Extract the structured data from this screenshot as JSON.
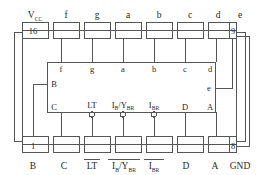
{
  "diagram": {
    "type": "ic-pinout",
    "colors": {
      "line": "#555555",
      "text": "#2a2a2a",
      "background": "#ffffff"
    },
    "package": {
      "top_left_pin_number": "16",
      "top_right_pin_number": "9",
      "bottom_left_pin_number": "1",
      "bottom_right_pin_number": "8"
    },
    "top_pins": [
      {
        "number": "16",
        "label": "Vcc",
        "label_base": "V",
        "label_sub": "CC",
        "inner_label": ""
      },
      {
        "number": "15",
        "label": "f",
        "label_base": "f",
        "label_sub": "",
        "inner_label": "f"
      },
      {
        "number": "14",
        "label": "g",
        "label_base": "g",
        "label_sub": "",
        "inner_label": "g"
      },
      {
        "number": "13",
        "label": "a",
        "label_base": "a",
        "label_sub": "",
        "inner_label": "a"
      },
      {
        "number": "12",
        "label": "b",
        "label_base": "b",
        "label_sub": "",
        "inner_label": "b"
      },
      {
        "number": "11",
        "label": "c",
        "label_base": "c",
        "label_sub": "",
        "inner_label": "c"
      },
      {
        "number": "10",
        "label": "d",
        "label_base": "d",
        "label_sub": "",
        "inner_label": "d"
      },
      {
        "number": "9",
        "label": "e",
        "label_base": "e",
        "label_sub": "",
        "inner_label": "e"
      }
    ],
    "bottom_pins": [
      {
        "number": "1",
        "label": "B",
        "label_base": "B",
        "label_sub": "",
        "overbar": false,
        "inner_label": "B",
        "bubble": false
      },
      {
        "number": "2",
        "label": "C",
        "label_base": "C",
        "label_sub": "",
        "overbar": false,
        "inner_label": "C",
        "bubble": false
      },
      {
        "number": "3",
        "label": "LT",
        "label_base": "LT",
        "label_sub": "",
        "overbar": true,
        "inner_label": "LT",
        "bubble": true
      },
      {
        "number": "4",
        "label": "IB/YBR",
        "label_base": "I",
        "label_sub": "B",
        "overbar": true,
        "inner_label": "IB/YBR",
        "bubble": true
      },
      {
        "number": "5",
        "label": "IBR",
        "label_base": "I",
        "label_sub": "BR",
        "overbar": true,
        "inner_label": "IBR",
        "bubble": true
      },
      {
        "number": "6",
        "label": "D",
        "label_base": "D",
        "label_sub": "",
        "overbar": false,
        "inner_label": "D",
        "bubble": false
      },
      {
        "number": "7",
        "label": "A",
        "label_base": "A",
        "label_sub": "",
        "overbar": false,
        "inner_label": "A",
        "bubble": false
      },
      {
        "number": "8",
        "label": "GND",
        "label_base": "GND",
        "label_sub": "",
        "overbar": false,
        "inner_label": "",
        "bubble": false
      }
    ],
    "inner_block": {
      "top_labels": [
        "f",
        "g",
        "a",
        "b",
        "c",
        "d"
      ],
      "right_label": "e",
      "left_label": "B",
      "bottom_labels": [
        "C",
        "LT",
        "IB/YBR",
        "IBR",
        "D",
        "A"
      ]
    }
  }
}
